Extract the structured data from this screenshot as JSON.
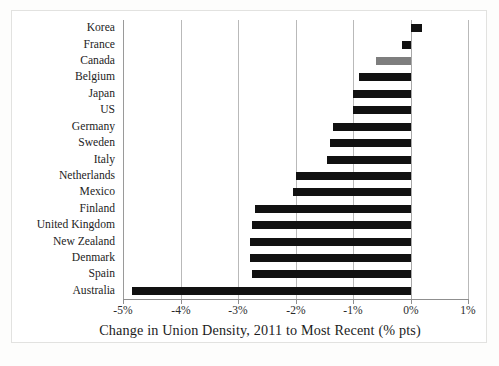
{
  "chart_data": {
    "type": "bar",
    "orientation": "horizontal",
    "title": "",
    "xlabel": "Change in Union Density, 2011 to Most Recent (% pts)",
    "ylabel": "",
    "xlim": [
      -5,
      1
    ],
    "xticks": [
      -5,
      -4,
      -3,
      -2,
      -1,
      0,
      1
    ],
    "xtick_labels": [
      "-5%",
      "-4%",
      "-3%",
      "-2%",
      "-1%",
      "0%",
      "1%"
    ],
    "grid": "vertical",
    "legend": "none",
    "categories": [
      "Korea",
      "France",
      "Canada",
      "Belgium",
      "Japan",
      "US",
      "Germany",
      "Sweden",
      "Italy",
      "Netherlands",
      "Mexico",
      "Finland",
      "United Kingdom",
      "New Zealand",
      "Denmark",
      "Spain",
      "Australia"
    ],
    "values": [
      0.2,
      -0.15,
      -0.6,
      -0.9,
      -1.0,
      -1.0,
      -1.35,
      -1.4,
      -1.45,
      -2.0,
      -2.05,
      -2.7,
      -2.75,
      -2.8,
      -2.8,
      -2.75,
      -4.85
    ],
    "bar_colors": [
      "#111111",
      "#111111",
      "#7e7e7e",
      "#111111",
      "#111111",
      "#111111",
      "#111111",
      "#111111",
      "#111111",
      "#111111",
      "#111111",
      "#111111",
      "#111111",
      "#111111",
      "#111111",
      "#111111",
      "#111111"
    ],
    "accent_color": "#111111",
    "highlight_color": "#7e7e7e",
    "gridline_color": "#b9b9b9",
    "background_color": "#ffffff"
  }
}
